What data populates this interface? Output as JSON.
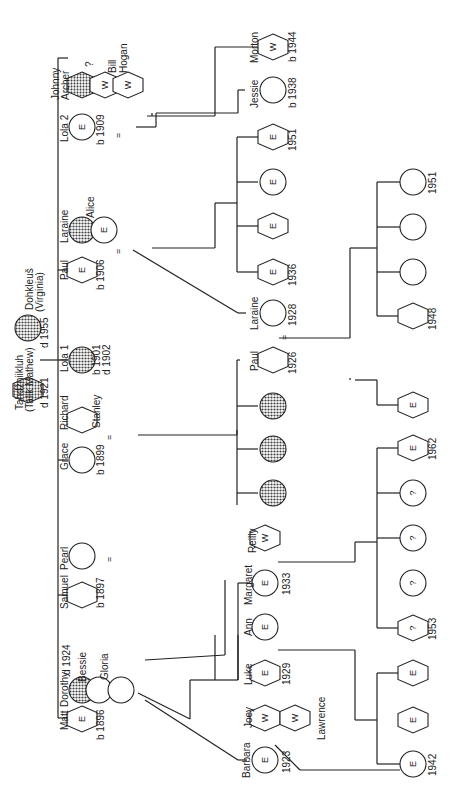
{
  "diagram": {
    "type": "genealogy-chart",
    "orientation": "rotated-90-ccw",
    "legend_markers": {
      "E": "E",
      "W": "W",
      "unknown": "?",
      "married": "="
    },
    "colors": {
      "line": "#222222",
      "deceased_fill": "#9a9a9a",
      "background": "#ffffff"
    },
    "founders": [
      {
        "name": "Tahdžniikluh",
        "alt_name": "(Talik Mathew)",
        "sex": "male",
        "deceased": true,
        "dates": "d 1921"
      },
      {
        "name": "Dohkleuš",
        "alt_name": "(Virginia)",
        "sex": "female",
        "deceased": true,
        "dates": "d 1955"
      }
    ],
    "generation2": [
      {
        "name": "Matt",
        "sex": "male",
        "marker": "E",
        "dates": "b 1896",
        "spouses": [
          {
            "name": "Dorothy",
            "sex": "female",
            "deceased": true,
            "dates": "d 1924"
          },
          {
            "name": "Bessie",
            "sex": "female"
          },
          {
            "name": "Gloria",
            "sex": "female"
          }
        ]
      },
      {
        "name": "Samuel",
        "sex": "male",
        "dates": "b 1897",
        "spouses": [
          {
            "name": "Pearl",
            "sex": "female"
          }
        ]
      },
      {
        "name": "Grace",
        "sex": "female",
        "dates": "b 1899",
        "spouses": [
          {
            "name": "Richard Stanley",
            "sex": "male"
          }
        ]
      },
      {
        "name": "Lola 1",
        "sex": "female",
        "deceased": true,
        "dates": "b 1901",
        "dates2": "d 1902"
      },
      {
        "name": "Paul",
        "sex": "male",
        "marker": "E",
        "dates": "b 1906",
        "spouses": [
          {
            "name": "Laraine",
            "sex": "female",
            "deceased": true
          },
          {
            "name": "Alice",
            "sex": "female",
            "marker": "E"
          }
        ]
      },
      {
        "name": "Lola 2",
        "sex": "female",
        "marker": "E",
        "dates": "b 1909",
        "spouses": [
          {
            "name": "Johnny Archer",
            "sex": "male",
            "deceased": true
          },
          {
            "name": "?",
            "sex": "male",
            "marker": "W"
          },
          {
            "name": "Bill Hogan",
            "sex": "male",
            "marker": "W"
          }
        ]
      }
    ],
    "generation3": [
      {
        "name": "Barbara",
        "marker": "E",
        "dates": "1923",
        "sex": "female",
        "spouses": [
          {
            "name": "Joey",
            "marker": "W",
            "sex": "male"
          },
          {
            "name": "Lawrence",
            "marker": "W",
            "sex": "male"
          }
        ]
      },
      {
        "name": "Luke",
        "marker": "E",
        "dates": "1929",
        "sex": "male"
      },
      {
        "name": "Ann",
        "marker": "E",
        "sex": "female"
      },
      {
        "name": "Margaret",
        "marker": "E",
        "dates": "1933",
        "sex": "female",
        "spouses": [
          {
            "name": "Reilly",
            "marker": "W",
            "sex": "male"
          }
        ]
      },
      {
        "name": "Paul",
        "dates": "1926",
        "sex": "male",
        "spouses": [
          {
            "name": "Laraine",
            "dates": "1928",
            "sex": "female"
          }
        ]
      },
      {
        "name": "Jessie",
        "dates": "b 1938",
        "sex": "female"
      },
      {
        "name": "Morton",
        "marker": "W",
        "dates": "b 1944",
        "sex": "male"
      }
    ],
    "labels": {
      "f1_name": "Tahdžniikluh",
      "f1_alt": "(Talik Mathew)",
      "f1_date": "d 1921",
      "f2_name": "Dohkleuš",
      "f2_alt": "(Virginia)",
      "f2_date": "d 1955",
      "matt": "Matt",
      "matt_b": "b 1896",
      "dorothy": "Dorothy",
      "dorothy_d": "d 1924",
      "bessie": "Bessie",
      "gloria": "Gloria",
      "samuel": "Samuel",
      "samuel_b": "b 1897",
      "pearl": "Pearl",
      "grace": "Grace",
      "grace_b": "b 1899",
      "richard": "Richard",
      "stanley": "Stanley",
      "lola1": "Lola 1",
      "lola1_b": "b 1901",
      "lola1_d": "d 1902",
      "paul": "Paul",
      "paul_b": "b 1906",
      "laraine": "Laraine",
      "alice": "Alice",
      "lola2": "Lola 2",
      "lola2_b": "b 1909",
      "johnny": "Johnny",
      "archer": "Archer",
      "unknown_q": "?",
      "bill": "Bill",
      "hogan": "Hogan",
      "barbara": "Barbara",
      "barbara_y": "1923",
      "joey": "Joey",
      "lawrence": "Lawrence",
      "luke": "Luke",
      "luke_y": "1929",
      "ann": "Ann",
      "margaret": "Margaret",
      "margaret_y": "1933",
      "reilly": "Reilly",
      "paul2": "Paul",
      "paul2_y": "1926",
      "laraine2": "Laraine",
      "laraine2_y": "1928",
      "jessie": "Jessie",
      "jessie_b": "b 1938",
      "morton": "Morton",
      "morton_b": "b 1944",
      "y1942": "1942",
      "y1953": "1953",
      "y1962": "1962",
      "y1948": "1948",
      "y1951a": "1951",
      "y1936": "1936",
      "y1951b": "1951",
      "E": "E",
      "W": "W",
      "Q": "?",
      "eq": "="
    }
  }
}
